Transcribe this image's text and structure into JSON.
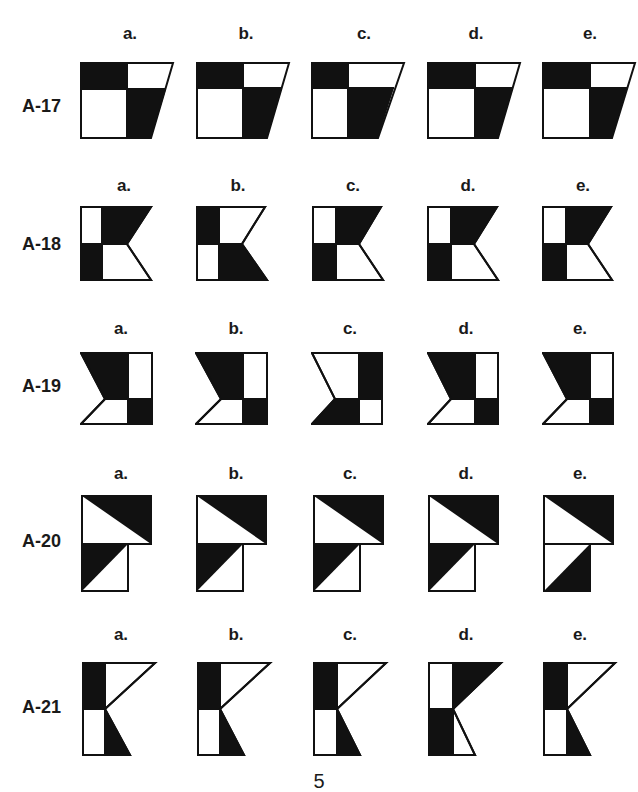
{
  "page_number": "5",
  "colors": {
    "fill": "#111111",
    "stroke": "#111111",
    "background": "#ffffff"
  },
  "options": [
    "a.",
    "b.",
    "c.",
    "d.",
    "e."
  ],
  "rows": [
    {
      "label": "A-17",
      "shape": "trapezoid-2x2",
      "options": [
        {
          "id": "a",
          "desc": "top-left black, bottom-right black"
        },
        {
          "id": "b",
          "desc": "top-left black, bottom-right black"
        },
        {
          "id": "c",
          "desc": "top-left black, bottom-right black"
        },
        {
          "id": "d",
          "desc": "top-left black, bottom-right black"
        },
        {
          "id": "e",
          "desc": "top-left black, bottom-right black"
        }
      ]
    },
    {
      "label": "A-18",
      "shape": "chevron-right",
      "options": [
        {
          "id": "a",
          "desc": "top-right black, bottom-left black"
        },
        {
          "id": "b",
          "desc": "top-left black, bottom-right black"
        },
        {
          "id": "c",
          "desc": "top-right black, bottom-left black"
        },
        {
          "id": "d",
          "desc": "top-right black, bottom-left black"
        },
        {
          "id": "e",
          "desc": "top-right black, bottom-left black"
        }
      ]
    },
    {
      "label": "A-19",
      "shape": "chevron-left",
      "options": [
        {
          "id": "a",
          "desc": "top-left black, bottom-right black"
        },
        {
          "id": "b",
          "desc": "top-left black, bottom-right black"
        },
        {
          "id": "c",
          "desc": "top-right black, bottom-left black"
        },
        {
          "id": "d",
          "desc": "top-left black, bottom-right black"
        },
        {
          "id": "e",
          "desc": "top-left black, bottom-right black"
        }
      ]
    },
    {
      "label": "A-20",
      "shape": "stacked-squares-diagonal",
      "options": [
        {
          "id": "a",
          "desc": "top upper-right triangle black, bottom upper-left triangle black"
        },
        {
          "id": "b",
          "desc": "top upper-right triangle black, bottom upper-left triangle black"
        },
        {
          "id": "c",
          "desc": "top upper-right triangle black, bottom upper-left triangle black"
        },
        {
          "id": "d",
          "desc": "top upper-right triangle black, bottom upper-left triangle black"
        },
        {
          "id": "e",
          "desc": "top upper-right triangle black, bottom lower-right triangle black"
        }
      ]
    },
    {
      "label": "A-21",
      "shape": "k-shape",
      "options": [
        {
          "id": "a",
          "desc": "top-left black, bottom-right black"
        },
        {
          "id": "b",
          "desc": "top-left black, bottom-right black"
        },
        {
          "id": "c",
          "desc": "top-left black, bottom-right black"
        },
        {
          "id": "d",
          "desc": "top-right black, bottom-left black"
        },
        {
          "id": "e",
          "desc": "top-left black, bottom-right black"
        }
      ]
    }
  ]
}
